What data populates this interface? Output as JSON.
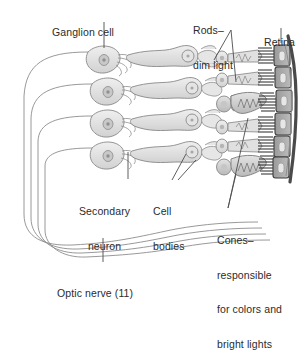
{
  "figure": {
    "type": "anatomical-diagram",
    "background_color": "#ffffff",
    "line_color": "#6e6e6e",
    "fill_light": "#dcdcdc",
    "fill_mid": "#bdbdbd",
    "fill_dark": "#2e2e2e",
    "text_color": "#2b2b2b"
  },
  "labels": {
    "ganglion_cell": "Ganglion cell",
    "rods_line1": "Rods–",
    "rods_line2": "dim light",
    "retina": "Retina",
    "secondary_line1": "Secondary",
    "secondary_line2": "neuron",
    "cell_bodies_line1": "Cell",
    "cell_bodies_line2": "bodies",
    "cones_line1": "Cones–",
    "cones_line2": "responsible",
    "cones_line3": "for colors and",
    "cones_line4": "bright lights",
    "optic_nerve": "Optic nerve (11)"
  },
  "structures": {
    "ganglion_cell_rows": 4,
    "secondary_neuron_rows": 4,
    "photoreceptor_rows": 6,
    "pigment_epithelium_cells": 6,
    "optic_nerve_fibers": 4,
    "rods_count": 4,
    "cones_count": 2
  }
}
